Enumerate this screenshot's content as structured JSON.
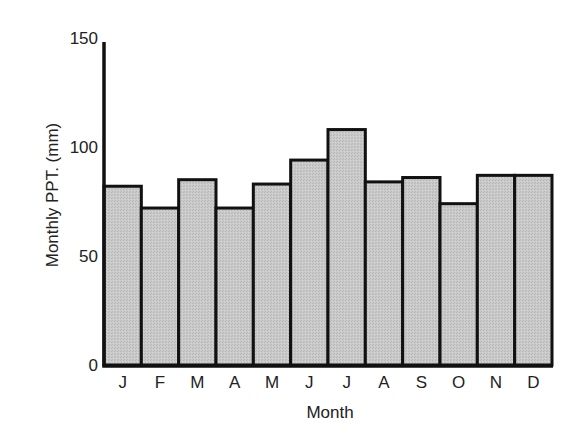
{
  "chart_data": {
    "type": "bar",
    "title": "",
    "xlabel": "Month",
    "ylabel": "Monthly PPT. (mm)",
    "categories": [
      "J",
      "F",
      "M",
      "A",
      "M",
      "J",
      "J",
      "A",
      "S",
      "O",
      "N",
      "D"
    ],
    "values": [
      82,
      72,
      85,
      72,
      83,
      94,
      108,
      84,
      86,
      74,
      87,
      87
    ],
    "ylim": [
      0,
      150
    ],
    "yticks": [
      0,
      50,
      100,
      150
    ],
    "grid": false,
    "legend": null,
    "colors": {
      "bar_fill": "#c6c6c6",
      "bar_edge": "#111111",
      "axis": "#111111",
      "text": "#222222"
    }
  }
}
